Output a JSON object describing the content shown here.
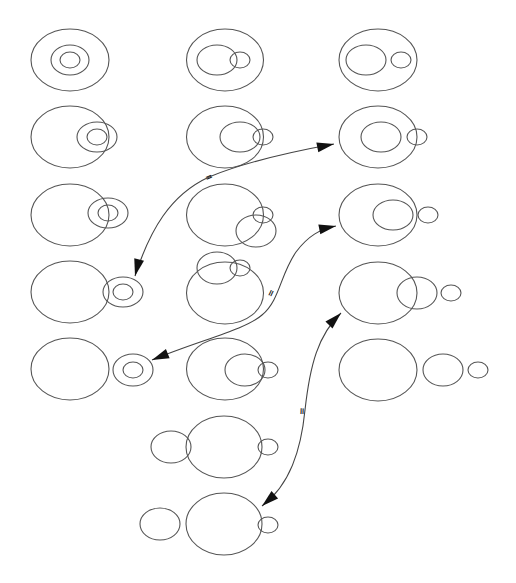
{
  "diagram": {
    "title": "",
    "stroke_color": "#555555",
    "arrow_color": "#111111",
    "background": "#ffffff",
    "configurations": [
      {
        "id": "r1c1",
        "ellipses": [
          {
            "cx": 70,
            "cy": 60,
            "rx": 39,
            "ry": 31
          },
          {
            "cx": 70,
            "cy": 60,
            "rx": 19,
            "ry": 15
          },
          {
            "cx": 70,
            "cy": 60,
            "rx": 10,
            "ry": 8
          }
        ]
      },
      {
        "id": "r1c2",
        "ellipses": [
          {
            "cx": 225,
            "cy": 60,
            "rx": 38.5,
            "ry": 31
          },
          {
            "cx": 217,
            "cy": 60,
            "rx": 20,
            "ry": 15
          },
          {
            "cx": 240,
            "cy": 60,
            "rx": 10,
            "ry": 8
          }
        ]
      },
      {
        "id": "r1c3",
        "ellipses": [
          {
            "cx": 378,
            "cy": 60,
            "rx": 39,
            "ry": 31
          },
          {
            "cx": 366,
            "cy": 60,
            "rx": 20,
            "ry": 15
          },
          {
            "cx": 401,
            "cy": 60,
            "rx": 10,
            "ry": 8
          }
        ]
      },
      {
        "id": "r2c1",
        "ellipses": [
          {
            "cx": 70,
            "cy": 137,
            "rx": 39,
            "ry": 31
          },
          {
            "cx": 97,
            "cy": 137,
            "rx": 20,
            "ry": 15
          },
          {
            "cx": 97,
            "cy": 137,
            "rx": 10,
            "ry": 8
          }
        ]
      },
      {
        "id": "r2c2",
        "ellipses": [
          {
            "cx": 225,
            "cy": 137,
            "rx": 38.5,
            "ry": 31
          },
          {
            "cx": 240,
            "cy": 137,
            "rx": 20,
            "ry": 15
          },
          {
            "cx": 263,
            "cy": 137,
            "rx": 10,
            "ry": 8
          }
        ]
      },
      {
        "id": "r2c3",
        "ellipses": [
          {
            "cx": 378,
            "cy": 137,
            "rx": 39,
            "ry": 31
          },
          {
            "cx": 381,
            "cy": 137,
            "rx": 20,
            "ry": 15
          },
          {
            "cx": 417,
            "cy": 137,
            "rx": 10,
            "ry": 8
          }
        ]
      },
      {
        "id": "r3c1",
        "ellipses": [
          {
            "cx": 70,
            "cy": 215,
            "rx": 39,
            "ry": 31
          },
          {
            "cx": 108,
            "cy": 213,
            "rx": 20,
            "ry": 15
          },
          {
            "cx": 108,
            "cy": 213,
            "rx": 10,
            "ry": 8
          }
        ]
      },
      {
        "id": "r3c2",
        "ellipses": [
          {
            "cx": 225,
            "cy": 215,
            "rx": 38.5,
            "ry": 31
          },
          {
            "cx": 256,
            "cy": 231,
            "rx": 20,
            "ry": 16
          },
          {
            "cx": 263,
            "cy": 215,
            "rx": 10,
            "ry": 8
          }
        ]
      },
      {
        "id": "r3c3",
        "ellipses": [
          {
            "cx": 378,
            "cy": 215,
            "rx": 39,
            "ry": 31
          },
          {
            "cx": 393,
            "cy": 215,
            "rx": 20,
            "ry": 15
          },
          {
            "cx": 428,
            "cy": 215,
            "rx": 10,
            "ry": 8
          }
        ]
      },
      {
        "id": "r4c1",
        "ellipses": [
          {
            "cx": 70,
            "cy": 292,
            "rx": 39,
            "ry": 31
          },
          {
            "cx": 123,
            "cy": 292,
            "rx": 20,
            "ry": 15
          },
          {
            "cx": 123,
            "cy": 292,
            "rx": 10,
            "ry": 8
          }
        ]
      },
      {
        "id": "r4c2",
        "ellipses": [
          {
            "cx": 225,
            "cy": 293,
            "rx": 38.5,
            "ry": 31
          },
          {
            "cx": 217,
            "cy": 268,
            "rx": 20,
            "ry": 16
          },
          {
            "cx": 240,
            "cy": 268,
            "rx": 10,
            "ry": 8
          }
        ]
      },
      {
        "id": "r4c3",
        "ellipses": [
          {
            "cx": 378,
            "cy": 293,
            "rx": 39,
            "ry": 31
          },
          {
            "cx": 417,
            "cy": 293,
            "rx": 20,
            "ry": 16
          },
          {
            "cx": 451,
            "cy": 293,
            "rx": 10,
            "ry": 8
          }
        ]
      },
      {
        "id": "r5c1",
        "ellipses": [
          {
            "cx": 70,
            "cy": 369,
            "rx": 39,
            "ry": 31
          },
          {
            "cx": 133,
            "cy": 370,
            "rx": 20,
            "ry": 16
          },
          {
            "cx": 133,
            "cy": 370,
            "rx": 10,
            "ry": 8
          }
        ]
      },
      {
        "id": "r5c2",
        "ellipses": [
          {
            "cx": 225,
            "cy": 369,
            "rx": 38.5,
            "ry": 31
          },
          {
            "cx": 245,
            "cy": 370,
            "rx": 20,
            "ry": 16
          },
          {
            "cx": 268,
            "cy": 370,
            "rx": 10,
            "ry": 8
          }
        ]
      },
      {
        "id": "r5c3",
        "ellipses": [
          {
            "cx": 378,
            "cy": 370,
            "rx": 39,
            "ry": 31
          },
          {
            "cx": 443,
            "cy": 370,
            "rx": 20,
            "ry": 16
          },
          {
            "cx": 478,
            "cy": 370,
            "rx": 10,
            "ry": 8
          }
        ]
      },
      {
        "id": "r6c2",
        "ellipses": [
          {
            "cx": 224,
            "cy": 447,
            "rx": 38,
            "ry": 31
          },
          {
            "cx": 171,
            "cy": 447,
            "rx": 20,
            "ry": 16
          },
          {
            "cx": 268,
            "cy": 447,
            "rx": 10,
            "ry": 8
          }
        ]
      },
      {
        "id": "r7c2",
        "ellipses": [
          {
            "cx": 224,
            "cy": 524,
            "rx": 38,
            "ry": 31
          },
          {
            "cx": 160,
            "cy": 524,
            "rx": 20,
            "ry": 16
          },
          {
            "cx": 268,
            "cy": 525,
            "rx": 10,
            "ry": 8
          }
        ]
      }
    ],
    "arrows": [
      {
        "id": "arrow-1",
        "path": "M135,276 C150,230 170,195 209,177 C245,162 290,152 334,144",
        "head_start": {
          "tip": [
            135,
            276
          ],
          "dir": [
            -0.25,
            1
          ]
        },
        "head_end": {
          "tip": [
            334,
            144
          ],
          "dir": [
            1,
            -0.2
          ]
        },
        "marker": {
          "label": "=",
          "x": 209,
          "y": 177,
          "angle": -22
        }
      },
      {
        "id": "arrow-2",
        "path": "M152,360 C200,340 245,330 262,315 C280,300 280,275 296,252 C308,236 320,229 336,226",
        "head_start": {
          "tip": [
            152,
            360
          ],
          "dir": [
            -1,
            0.4
          ]
        },
        "head_end": {
          "tip": [
            336,
            226
          ],
          "dir": [
            1,
            -0.2
          ]
        },
        "marker": {
          "label": "=",
          "x": 271,
          "y": 293,
          "angle": -65
        }
      },
      {
        "id": "arrow-3",
        "path": "M341,313 C318,335 310,365 305,410 C301,450 290,485 262,506",
        "head_start": {
          "tip": [
            341,
            313
          ],
          "dir": [
            0.8,
            -0.8
          ]
        },
        "head_end": {
          "tip": [
            262,
            506
          ],
          "dir": [
            -0.8,
            0.7
          ]
        },
        "marker": {
          "label": "=",
          "x": 302,
          "y": 411,
          "angle": -88
        }
      }
    ]
  }
}
